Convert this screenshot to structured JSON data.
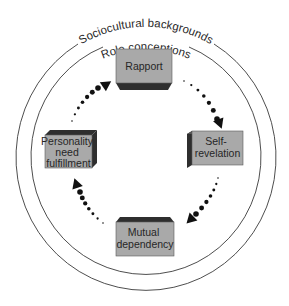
{
  "diagram": {
    "outer_ring_label": "Sociocultural backgrounds",
    "inner_ring_label": "Role conceptions",
    "stages": [
      {
        "id": "rapport",
        "lines": [
          "Rapport"
        ]
      },
      {
        "id": "self-revelation",
        "lines": [
          "Self-",
          "revelation"
        ]
      },
      {
        "id": "mutual-dependency",
        "lines": [
          "Mutual",
          "dependency"
        ]
      },
      {
        "id": "personality-need-fulfillment",
        "lines": [
          "Personality",
          "need",
          "fulfillment"
        ]
      }
    ],
    "cycle_direction": "clockwise",
    "flow": [
      {
        "from": "rapport",
        "to": "self-revelation"
      },
      {
        "from": "self-revelation",
        "to": "mutual-dependency"
      },
      {
        "from": "mutual-dependency",
        "to": "personality-need-fulfillment"
      },
      {
        "from": "personality-need-fulfillment",
        "to": "rapport"
      }
    ],
    "colors": {
      "box_face": "#a9a9a9",
      "box_shadow": "#2e2e2e",
      "ring_stroke": "#3a3a3a",
      "arrow": "#111111"
    }
  }
}
